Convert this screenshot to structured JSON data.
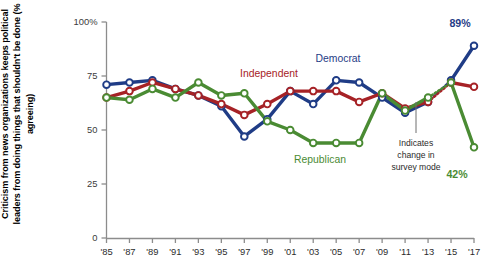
{
  "chart_data": {
    "type": "line",
    "title": "",
    "ylabel": "Criticism from news organizations keeps political leaders from doing things that shouldn't be done (% agreeing)",
    "xlabel": "",
    "ylim": [
      0,
      100
    ],
    "ytick_labels": [
      "0",
      "25",
      "50",
      "75",
      "100%"
    ],
    "ytick_values": [
      0,
      25,
      50,
      75,
      100
    ],
    "xtick_labels": [
      "'85",
      "'87",
      "'89",
      "'91",
      "'93",
      "'95",
      "'97",
      "'99",
      "'01",
      "'03",
      "'05",
      "'07",
      "'09",
      "'11",
      "'13",
      "'15",
      "'17"
    ],
    "x": [
      1985,
      1987,
      1989,
      1991,
      1993,
      1995,
      1997,
      1999,
      2001,
      2003,
      2005,
      2007,
      2009,
      2011,
      2013,
      2015,
      2017
    ],
    "grid": false,
    "legend_position": "inline-annotations",
    "series": [
      {
        "name": "Democrat",
        "color": "#1f3c86",
        "label_color": "#1f3c86",
        "values": [
          71,
          72,
          73,
          69,
          66,
          61,
          47,
          55,
          68,
          62,
          73,
          72,
          65,
          58,
          63,
          73,
          89
        ]
      },
      {
        "name": "Independent",
        "color": "#a62226",
        "label_color": "#a62226",
        "values": [
          65,
          68,
          72,
          69,
          66,
          62,
          57,
          62,
          68,
          68,
          68,
          63,
          67,
          60,
          63,
          72,
          70
        ]
      },
      {
        "name": "Republican",
        "color": "#4a8b33",
        "label_color": "#4a8b33",
        "values": [
          65,
          64,
          69,
          65,
          72,
          66,
          67,
          54,
          50,
          44,
          44,
          44,
          67,
          59,
          65,
          72,
          42
        ]
      }
    ],
    "end_labels": [
      {
        "text": "89%",
        "series": "Democrat",
        "color": "#1f3c86"
      },
      {
        "text": "42%",
        "series": "Republican",
        "color": "#4a8b33"
      }
    ],
    "series_labels": [
      {
        "text": "Democrat",
        "color": "#1f3c86"
      },
      {
        "text": "Independent",
        "color": "#a62226"
      },
      {
        "text": "Republican",
        "color": "#4a8b33"
      }
    ],
    "annotations": [
      {
        "text_lines": [
          "Indicates",
          "change in",
          "survey mode"
        ],
        "style": "dotted-connector"
      }
    ]
  }
}
